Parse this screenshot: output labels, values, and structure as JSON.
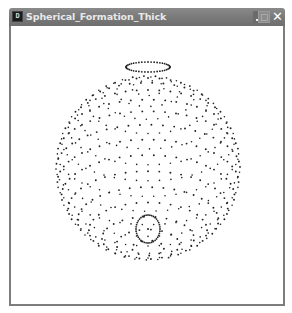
{
  "window": {
    "title": "Spherical_Formation_Thick",
    "app_icon_glyph": "D",
    "controls": {
      "minimize_icon": "minimize-icon",
      "maximize_icon": "maximize-icon",
      "close_glyph": "✕"
    },
    "colors": {
      "titlebar": "#7a7a7a",
      "title_text": "#e8e8e8",
      "border": "#7d7d7d",
      "canvas_bg": "#ffffff",
      "dot": "#222222"
    }
  },
  "scene": {
    "description": "Dotted sphere point cloud viewed slightly from above and front",
    "center": [
      137,
      142
    ],
    "radius": 92,
    "tilt_deg": 62,
    "latitude_rings": 18,
    "dots_per_ring_base": 36,
    "top_pole_ring": {
      "cx": 137,
      "cy": 41,
      "rx": 22,
      "ry": 5
    },
    "front_pole": {
      "cx": 137,
      "cy": 203,
      "rx": 12,
      "ry": 14,
      "center_dot": true
    }
  }
}
